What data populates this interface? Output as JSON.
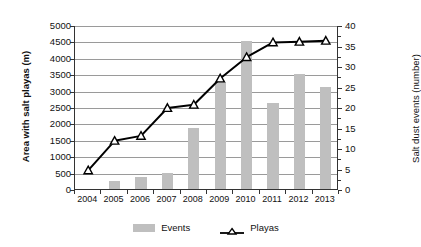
{
  "chart_data": {
    "type": "bar",
    "title": "",
    "subtitle": "",
    "xlabel": "",
    "categories": [
      "2004",
      "2005",
      "2006",
      "2007",
      "2008",
      "2009",
      "2010",
      "2011",
      "2012",
      "2013"
    ],
    "grid": true,
    "legend_position": "bottom",
    "axes": {
      "left": {
        "label": "Area with salt playas (m)",
        "min": 0,
        "max": 5000,
        "step": 500,
        "ticks": [
          "0",
          "500",
          "1000",
          "1500",
          "2000",
          "2500",
          "3000",
          "3500",
          "4000",
          "4500",
          "5000"
        ]
      },
      "right": {
        "label": "Salt dust events (number)",
        "min": 0,
        "max": 40,
        "step": 5,
        "ticks": [
          "0",
          "5",
          "10",
          "15",
          "20",
          "25",
          "30",
          "35",
          "40"
        ]
      }
    },
    "series": [
      {
        "name": "Events",
        "type": "bar",
        "axis": "right",
        "color": "#bfbfbf",
        "values": [
          0,
          2,
          3,
          4,
          15,
          26,
          36,
          21,
          28,
          25
        ]
      },
      {
        "name": "Playas",
        "type": "line",
        "axis": "left",
        "color": "#000000",
        "marker": "triangle",
        "values": [
          600,
          1500,
          1650,
          2500,
          2600,
          3400,
          4050,
          4500,
          4520,
          4550
        ]
      }
    ]
  },
  "legend": {
    "items": [
      {
        "label": "Events",
        "kind": "bar-swatch"
      },
      {
        "label": "Playas",
        "kind": "line-marker-swatch"
      }
    ]
  }
}
